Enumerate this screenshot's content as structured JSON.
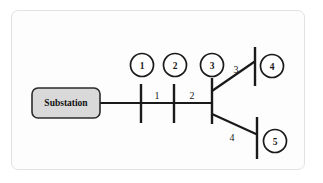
{
  "diagram": {
    "source": {
      "label": "Substation",
      "shape": "rounded-rectangle",
      "fill_color": "#d9d9d9",
      "stroke_color": "#2b2b2b"
    },
    "nodes": [
      {
        "id": "1",
        "label": "1",
        "cx": 142,
        "cy": 65,
        "r": 11.5
      },
      {
        "id": "2",
        "label": "2",
        "cx": 175,
        "cy": 65,
        "r": 11.5
      },
      {
        "id": "3",
        "label": "3",
        "cx": 212,
        "cy": 65,
        "r": 11.5
      },
      {
        "id": "4",
        "label": "4",
        "cx": 272,
        "cy": 66,
        "r": 11.5
      },
      {
        "id": "5",
        "label": "5",
        "cx": 275,
        "cy": 141,
        "r": 11.5
      }
    ],
    "busbars": [
      {
        "id": "busbar-1",
        "x": 141,
        "y1": 84,
        "y2": 123
      },
      {
        "id": "busbar-2",
        "x": 174,
        "y1": 84,
        "y2": 123
      },
      {
        "id": "busbar-3",
        "x": 212,
        "y1": 78,
        "y2": 124
      },
      {
        "id": "busbar-4",
        "x": 255,
        "y1": 47,
        "y2": 86
      },
      {
        "id": "busbar-5",
        "x": 257,
        "y1": 117,
        "y2": 159
      }
    ],
    "segments": [
      {
        "id": "segment-1",
        "label": "1",
        "label_x": 157,
        "label_y": 99,
        "from": "busbar-1",
        "to": "busbar-2"
      },
      {
        "id": "segment-2",
        "label": "2",
        "label_x": 192,
        "label_y": 99,
        "from": "busbar-2",
        "to": "busbar-3"
      },
      {
        "id": "segment-3",
        "label": "3",
        "label_x": 236,
        "label_y": 73,
        "from": "node-3",
        "to": "busbar-4"
      },
      {
        "id": "segment-4",
        "label": "4",
        "label_x": 232,
        "label_y": 141,
        "from": "node-3",
        "to": "busbar-5"
      }
    ],
    "feeder_main": {
      "x1": 100,
      "x2": 212,
      "y": 103
    },
    "branch_upper": {
      "x1": 212,
      "y1": 91,
      "x2": 254,
      "y2": 62
    },
    "branch_lower": {
      "x1": 212,
      "y1": 114,
      "x2": 256,
      "y2": 134
    },
    "colors": {
      "line": "#1a1a1a",
      "frame": "#e2e2e2",
      "background": "#fdfdfd"
    }
  }
}
